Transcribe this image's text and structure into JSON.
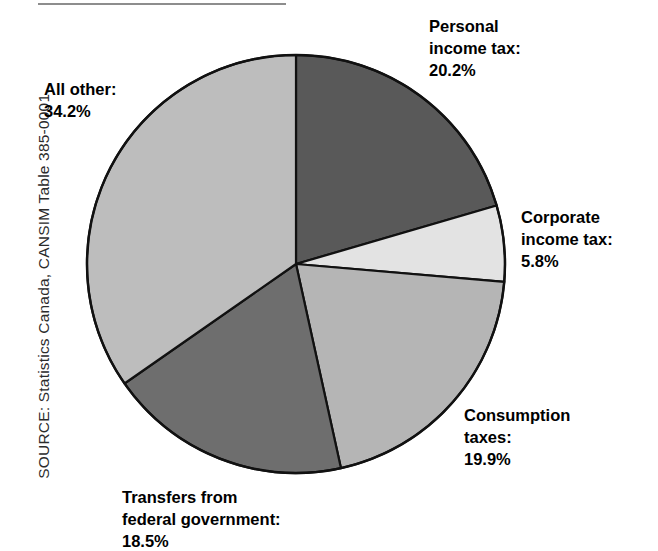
{
  "source_note": "SOURCE: Statistics Canada, CANSIM Table 385-0001.",
  "labels": {
    "personal": "Personal\nincome tax:\n20.2%",
    "corporate": "Corporate\nincome tax:\n5.8%",
    "consumption": "Consumption\ntaxes:\n19.9%",
    "transfers": "Transfers from\nfederal government:\n18.5%",
    "allother": "All other:\n34.2%"
  },
  "chart_data": {
    "type": "pie",
    "title": "",
    "subtitle": "",
    "xlabel": "",
    "ylabel": "",
    "grid": false,
    "legend_position": "none",
    "labels_outside": true,
    "start_angle_deg": 0,
    "direction": "clockwise",
    "units": "percent",
    "total": 98.6,
    "categories": [
      "Personal income tax",
      "Corporate income tax",
      "Consumption taxes",
      "Transfers from federal government",
      "All other"
    ],
    "values": [
      20.2,
      5.8,
      19.9,
      18.5,
      34.2
    ],
    "value_labels": [
      "20.2%",
      "5.8%",
      "19.9%",
      "18.5%",
      "34.2%"
    ],
    "slice_colors": [
      "#595959",
      "#e3e3e3",
      "#b5b5b5",
      "#6e6e6e",
      "#bdbdbd"
    ],
    "slice_border_color": "#111111",
    "slices": [
      {
        "name": "Personal income tax",
        "value": 20.2,
        "label": "20.2%",
        "color": "#595959"
      },
      {
        "name": "Corporate income tax",
        "value": 5.8,
        "label": "5.8%",
        "color": "#e3e3e3"
      },
      {
        "name": "Consumption taxes",
        "value": 19.9,
        "label": "19.9%",
        "color": "#b5b5b5"
      },
      {
        "name": "Transfers from federal government",
        "value": 18.5,
        "label": "18.5%",
        "color": "#6e6e6e"
      },
      {
        "name": "All other",
        "value": 34.2,
        "label": "34.2%",
        "color": "#bdbdbd"
      }
    ]
  },
  "colors": {
    "rule": "#8d8d8d",
    "text": "#000000",
    "source_text": "#2b2b2b",
    "background": "#ffffff"
  }
}
